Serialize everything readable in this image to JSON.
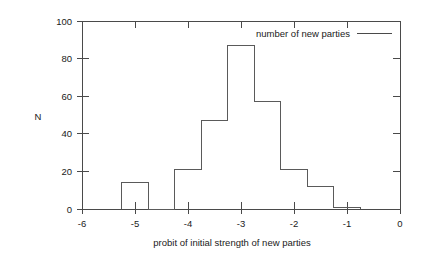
{
  "chart_data": {
    "type": "bar",
    "title": "",
    "xlabel": "probit of initial strength of new parties",
    "ylabel": "N",
    "xlim": [
      -6,
      0
    ],
    "ylim": [
      0,
      100
    ],
    "grid": false,
    "legend_position": "top-right",
    "legend": [
      "number of new parties"
    ],
    "xticks": [
      "-6",
      "-5",
      "-4",
      "-3",
      "-2",
      "-1",
      "0"
    ],
    "xtick_values": [
      -6,
      -5,
      -4,
      -3,
      -2,
      -1,
      0
    ],
    "yticks": [
      "0",
      "20",
      "40",
      "60",
      "80",
      "100"
    ],
    "ytick_values": [
      0,
      20,
      40,
      60,
      80,
      100
    ],
    "bin_width": 0.5,
    "bin_edges": [
      -5.25,
      -4.75,
      -4.25,
      -3.75,
      -3.25,
      -2.75,
      -2.25,
      -1.75,
      -1.25,
      -0.75
    ],
    "categories": [
      "-5.0",
      "-4.5",
      "-4.0",
      "-3.5",
      "-3.0",
      "-2.5",
      "-2.0",
      "-1.5",
      "-1.0"
    ],
    "values": [
      14,
      0,
      21,
      47,
      87,
      57,
      21,
      12,
      1
    ],
    "series": [
      {
        "name": "number of new parties",
        "values": [
          14,
          0,
          21,
          47,
          87,
          57,
          21,
          12,
          1
        ]
      }
    ]
  },
  "axes": {
    "y_label": "N",
    "x_label": "probit of initial strength of new parties"
  },
  "legend": {
    "entry_label": "number of new parties"
  }
}
